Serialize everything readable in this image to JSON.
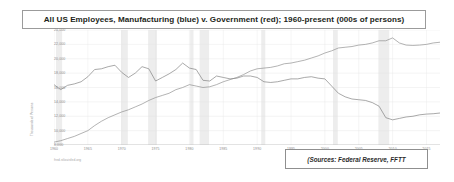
{
  "title": {
    "text": "All US Employees, Manufacturing (blue) v. Government (red); 1960-present (000s of persons)"
  },
  "sources": {
    "text": "(Sources:  Federal Reserve, FFTT"
  },
  "credit": {
    "text": "fred.stlouisfed.org"
  },
  "chart_data": {
    "type": "line",
    "title": "All US Employees, Manufacturing (blue) v. Government (red); 1960-present (000s of persons)",
    "xlabel": "",
    "ylabel": "Thousands of Persons",
    "xlim": [
      1960,
      2017
    ],
    "ylim": [
      8000,
      24000
    ],
    "ytick_labels": [
      "24,000",
      "22,000",
      "20,000",
      "18,000",
      "16,000",
      "14,000",
      "12,000",
      "10,000",
      "8,000"
    ],
    "ytick_values": [
      24000,
      22000,
      20000,
      18000,
      16000,
      14000,
      12000,
      10000,
      8000
    ],
    "xtick_labels": [
      "1960",
      "1965",
      "1970",
      "1975",
      "1980",
      "1985",
      "1990",
      "1995",
      "2000",
      "2005",
      "2010",
      "2015"
    ],
    "xtick_values": [
      1960,
      1965,
      1970,
      1975,
      1980,
      1985,
      1990,
      1995,
      2000,
      2005,
      2010,
      2015
    ],
    "grid": true,
    "legend_position": "none",
    "recession_bands": [
      [
        1960.3,
        1961.2
      ],
      [
        1969.9,
        1970.9
      ],
      [
        1973.9,
        1975.2
      ],
      [
        1980.1,
        1980.6
      ],
      [
        1981.5,
        1982.9
      ],
      [
        1990.6,
        1991.2
      ],
      [
        2001.2,
        2001.9
      ],
      [
        2007.9,
        2009.5
      ]
    ],
    "series": [
      {
        "name": "Manufacturing",
        "color": "#7a7a7a",
        "x": [
          1960,
          1961,
          1962,
          1963,
          1964,
          1965,
          1966,
          1967,
          1968,
          1969,
          1970,
          1971,
          1972,
          1973,
          1974,
          1975,
          1976,
          1977,
          1978,
          1979,
          1980,
          1981,
          1982,
          1983,
          1984,
          1985,
          1986,
          1987,
          1988,
          1989,
          1990,
          1991,
          1992,
          1993,
          1994,
          1995,
          1996,
          1997,
          1998,
          1999,
          2000,
          2001,
          2002,
          2003,
          2004,
          2005,
          2006,
          2007,
          2008,
          2009,
          2010,
          2011,
          2012,
          2013,
          2014,
          2015,
          2016,
          2017
        ],
        "values": [
          16400,
          15700,
          16300,
          16500,
          16800,
          17500,
          18500,
          18600,
          18900,
          19100,
          18100,
          17400,
          18000,
          18900,
          18600,
          16900,
          17400,
          17900,
          18500,
          19400,
          18700,
          18500,
          17000,
          16900,
          17600,
          17400,
          17200,
          17300,
          17600,
          17600,
          17400,
          16800,
          16700,
          16800,
          17000,
          17200,
          17200,
          17400,
          17500,
          17300,
          17200,
          16200,
          15200,
          14700,
          14400,
          14300,
          14200,
          13900,
          13400,
          11800,
          11500,
          11700,
          11900,
          12000,
          12200,
          12300,
          12350,
          12450
        ]
      },
      {
        "name": "Government",
        "color": "#8a8a8a",
        "x": [
          1960,
          1961,
          1962,
          1963,
          1964,
          1965,
          1966,
          1967,
          1968,
          1969,
          1970,
          1971,
          1972,
          1973,
          1974,
          1975,
          1976,
          1977,
          1978,
          1979,
          1980,
          1981,
          1982,
          1983,
          1984,
          1985,
          1986,
          1987,
          1988,
          1989,
          1990,
          1991,
          1992,
          1993,
          1994,
          1995,
          1996,
          1997,
          1998,
          1999,
          2000,
          2001,
          2002,
          2003,
          2004,
          2005,
          2006,
          2007,
          2008,
          2009,
          2010,
          2011,
          2012,
          2013,
          2014,
          2015,
          2016,
          2017
        ],
        "values": [
          8400,
          8600,
          8900,
          9200,
          9600,
          10000,
          10700,
          11300,
          11800,
          12200,
          12600,
          12900,
          13300,
          13700,
          14200,
          14600,
          14900,
          15200,
          15700,
          16000,
          16400,
          16200,
          16000,
          16100,
          16400,
          16800,
          17100,
          17400,
          17800,
          18300,
          18600,
          18700,
          18800,
          19000,
          19300,
          19400,
          19600,
          19800,
          20100,
          20400,
          20800,
          21100,
          21500,
          21600,
          21700,
          21900,
          22000,
          22200,
          22500,
          22500,
          22900,
          22200,
          21900,
          21850,
          21900,
          22000,
          22200,
          22300
        ]
      }
    ]
  }
}
